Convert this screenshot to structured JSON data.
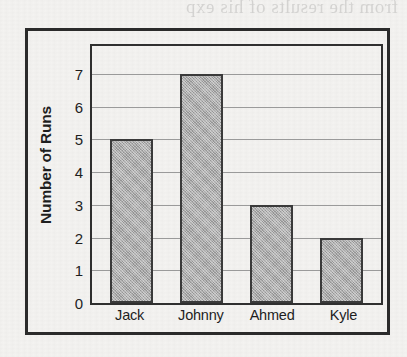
{
  "chart_data": {
    "type": "bar",
    "title": "",
    "xlabel": "",
    "ylabel": "Number of Runs",
    "categories": [
      "Jack",
      "Johnny",
      "Ahmed",
      "Kyle"
    ],
    "values": [
      5,
      7,
      3,
      2
    ],
    "ylim": [
      0,
      7
    ],
    "ytick_labels": [
      "7",
      "6",
      "5",
      "4",
      "3",
      "2",
      "1",
      "0"
    ],
    "ytick_values": [
      7,
      6,
      5,
      4,
      3,
      2,
      1,
      0
    ],
    "grid": true,
    "grid_axis": "y",
    "legend": false,
    "legend_position": "none",
    "orientation": "vertical",
    "bar_fill_color": "#ababab",
    "bar_edge_color": "#3a3a3a",
    "gridline_color": "#9a9a9a",
    "frame_color": "#2b2b2b",
    "background_color": "#f4f3f1",
    "text_color": "#1e1e1e"
  },
  "artifacts": {
    "bleed_through_text": "from the results of his exp"
  }
}
